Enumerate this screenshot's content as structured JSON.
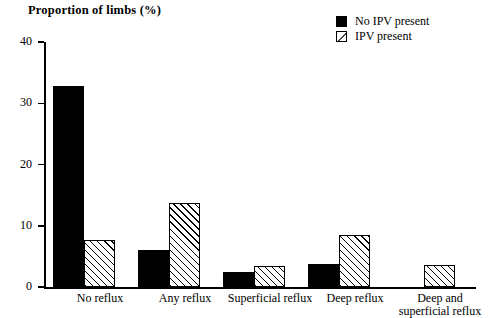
{
  "chart_data": {
    "type": "bar",
    "title": "Proportion of limbs (%)",
    "xlabel": "",
    "ylabel": "Proportion of limbs (%)",
    "ylim": [
      0,
      40
    ],
    "yticks": [
      0,
      10,
      20,
      30,
      40
    ],
    "ytick_labels": [
      "0",
      "10",
      "20",
      "30",
      "40"
    ],
    "grid": false,
    "legend_position": "top-right",
    "categories": [
      "No reflux",
      "Any reflux",
      "Superficial reflux",
      "Deep reflux",
      "Deep and\nsuperficial reflux"
    ],
    "series": [
      {
        "name": "No IPV present",
        "fill": "solid-black",
        "values": [
          32.8,
          6.1,
          2.4,
          3.8,
          0
        ]
      },
      {
        "name": "IPV present",
        "fill": "diagonal-hatch",
        "values": [
          7.7,
          13.7,
          3.4,
          8.5,
          3.6
        ]
      }
    ]
  },
  "legend": {
    "items": [
      {
        "label": "No IPV present",
        "swatch": "solid-black-swatch"
      },
      {
        "label": "IPV present",
        "swatch": "hatched-swatch"
      }
    ]
  },
  "colors": {
    "series_no_ipv": "#000000",
    "series_ipv_background": "#ffffff",
    "series_ipv_hatch": "#000000",
    "axis": "#000000",
    "background": "#ffffff"
  }
}
